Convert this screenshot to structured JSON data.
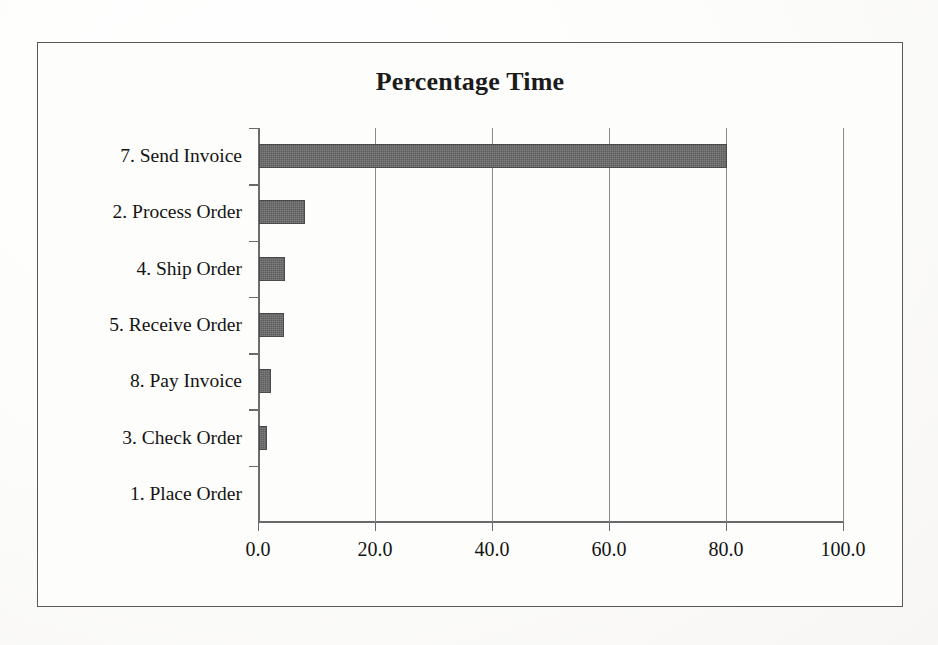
{
  "document": {
    "kind": "scanned-bar-chart",
    "paper_color": "#fdfdfb",
    "frame_color": "#58585a"
  },
  "chart_data": {
    "type": "bar",
    "orientation": "horizontal",
    "title": "Percentage Time",
    "xlabel": "",
    "ylabel": "",
    "categories": [
      "7. Send Invoice",
      "2. Process Order",
      "4. Ship Order",
      "5. Receive Order",
      "8. Pay Invoice",
      "3. Check Order",
      "1. Place Order"
    ],
    "values": [
      80.0,
      7.8,
      4.4,
      4.2,
      2.0,
      1.4,
      0.0
    ],
    "xlim": [
      0.0,
      100.0
    ],
    "xticks": [
      0.0,
      20.0,
      40.0,
      60.0,
      80.0,
      100.0
    ],
    "xticklabels": [
      "0.0",
      "20.0",
      "40.0",
      "60.0",
      "80.0",
      "100.0"
    ],
    "grid": "vertical",
    "legend": null,
    "bar_color": "#5d5d5d",
    "gridline_color": "#8a8a8c",
    "axis_color": "#6a6a6c"
  }
}
